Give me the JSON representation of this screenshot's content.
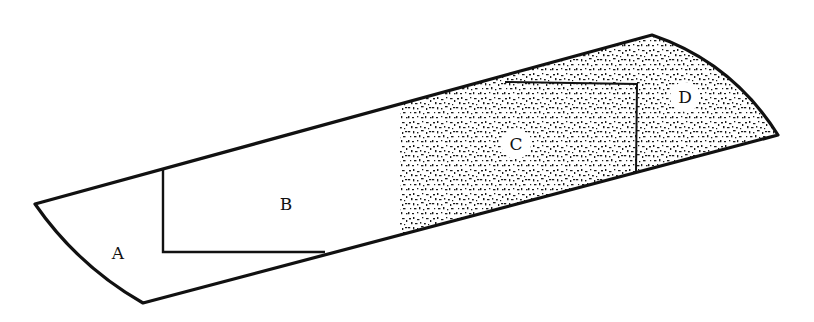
{
  "figure": {
    "colors": {
      "line": "#111111",
      "stipple": "#1a1a1a",
      "background": "#ffffff"
    }
  },
  "regions": [
    {
      "id": "A",
      "label": "A",
      "shaded": false
    },
    {
      "id": "B",
      "label": "B",
      "shaded": false
    },
    {
      "id": "C",
      "label": "C",
      "shaded": true
    },
    {
      "id": "D",
      "label": "D",
      "shaded": true
    }
  ]
}
